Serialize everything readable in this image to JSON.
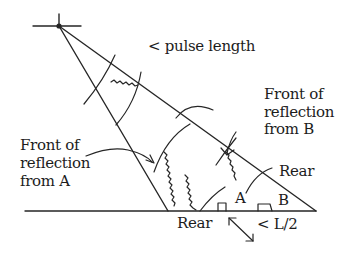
{
  "diagram": {
    "type": "radar pulse reflection geometry",
    "labels": {
      "pulse_length": "< pulse length",
      "front_b_line1": "Front of",
      "front_b_line2": "reflection",
      "front_b_line3": "from B",
      "front_a_line1": "Front of",
      "front_a_line2": "reflection",
      "front_a_line3": "from A",
      "rear_right": "Rear",
      "rear_bottom": "Rear",
      "point_a": "A",
      "point_b": "B",
      "half_length": "< L/2"
    },
    "elements": [
      "antenna-source",
      "beam-left-edge",
      "beam-right-edge",
      "ground-line",
      "pulse-front-arc",
      "pulse-rear-arc",
      "reflector-a",
      "reflector-b"
    ],
    "colors": {
      "ink": "#262626",
      "background": "#ffffff"
    }
  }
}
